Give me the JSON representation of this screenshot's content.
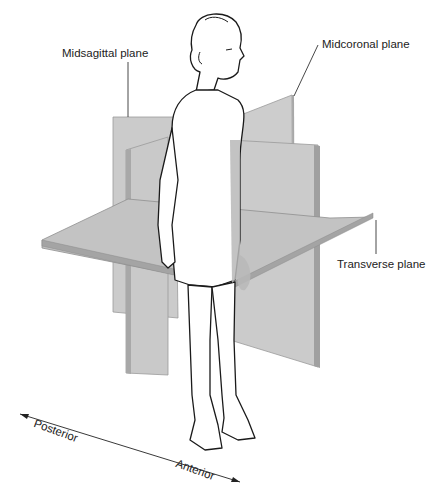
{
  "figure": {
    "labels": {
      "midsagittal": "Midsagittal plane",
      "midcoronal": "Midcoronal plane",
      "transverse": "Transverse plane",
      "posterior": "Posterior",
      "anterior": "Anterior"
    },
    "colors": {
      "plane_face": "#c8c8c8",
      "plane_face_light": "#d4d4d4",
      "plane_edge": "#a8a8a8",
      "body_overlap": "#b4b4b4",
      "outline": "#1a1a1a",
      "text": "#222222"
    }
  }
}
